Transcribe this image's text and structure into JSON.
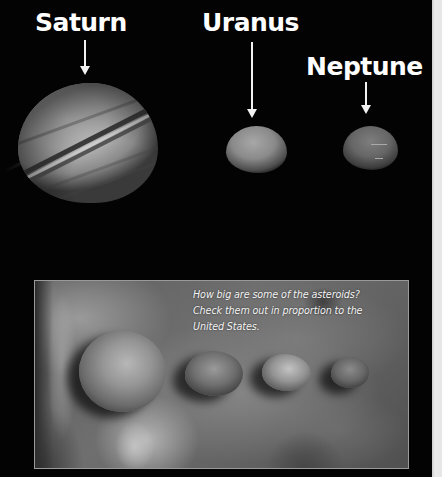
{
  "labels": {
    "saturn": "Saturn",
    "uranus": "Uranus",
    "neptune": "Neptune"
  },
  "planets": [
    {
      "name": "Saturn",
      "icon": "planet-with-rings"
    },
    {
      "name": "Uranus",
      "icon": "planet"
    },
    {
      "name": "Neptune",
      "icon": "planet"
    }
  ],
  "inset": {
    "caption_lines": [
      "How big are some of the asteroids?",
      "Check them out in proportion to the",
      "United States."
    ],
    "asteroid_count": 4,
    "background": "map of the United States"
  },
  "colors": {
    "space": "#030303",
    "label": "#ffffff",
    "edge_strip": "#e9e9e9",
    "inset_border": "#9a9a9a"
  }
}
